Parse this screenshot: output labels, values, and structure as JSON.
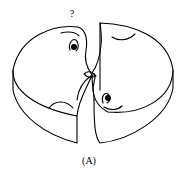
{
  "figure": {
    "question_mark": "?",
    "caption": "(A)",
    "stroke_color": "#000000",
    "background": "#ffffff"
  }
}
